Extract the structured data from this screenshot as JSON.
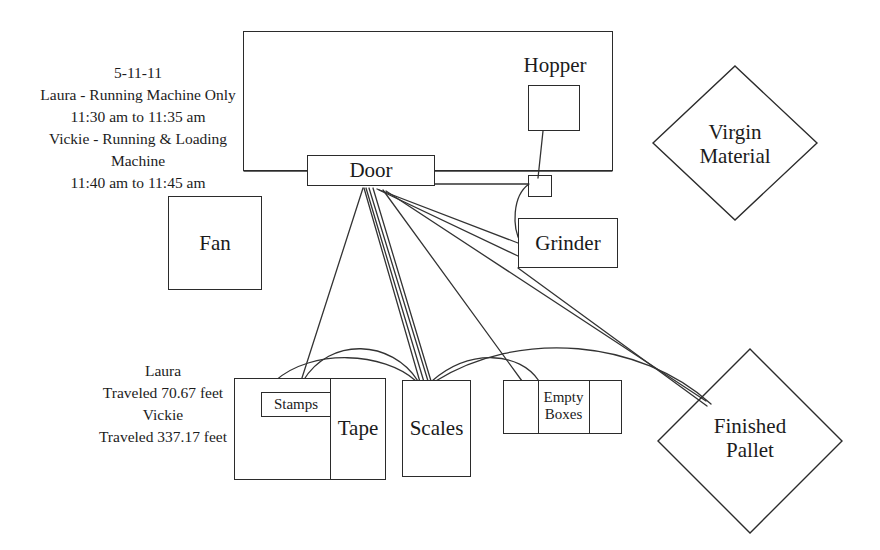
{
  "diagram": {
    "notes": [
      {
        "id": "time-study-note",
        "text": "5-11-11\nLaura - Running Machine Only\n11:30 am to 11:35 am\nVickie - Running & Loading\nMachine\n11:40 am to 11:45 am"
      },
      {
        "id": "distance-note",
        "text": "Laura\nTraveled 70.67 feet\nVickie\nTraveled 337.17 feet"
      }
    ],
    "nodes": {
      "room": {
        "label": ""
      },
      "hopper": {
        "label": "Hopper"
      },
      "hopper_box": {
        "label": ""
      },
      "small_square": {
        "label": ""
      },
      "door": {
        "label": "Door"
      },
      "grinder": {
        "label": "Grinder"
      },
      "fan": {
        "label": "Fan"
      },
      "virgin_material": {
        "label": "Virgin\nMaterial"
      },
      "finished_pallet": {
        "label": "Finished\nPallet"
      },
      "work_table": {
        "label": ""
      },
      "stamps": {
        "label": "Stamps"
      },
      "tape": {
        "label": "Tape"
      },
      "scales": {
        "label": "Scales"
      },
      "empty_boxes": {
        "label": "Empty\nBoxes"
      }
    },
    "colors": {
      "stroke": "#2b2b2b",
      "path": "#333333",
      "background": "#ffffff",
      "text": "#1c1c1c"
    }
  }
}
